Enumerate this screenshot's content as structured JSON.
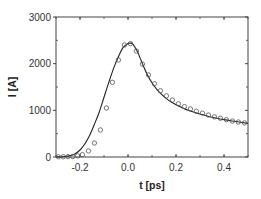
{
  "chart_data": {
    "type": "line",
    "title": "",
    "xlabel": "t [ps]",
    "ylabel": "I  [A]",
    "xlim": [
      -0.3,
      0.5
    ],
    "ylim": [
      0,
      3000
    ],
    "x_ticks": [
      -0.2,
      0.0,
      0.2,
      0.4
    ],
    "x_tick_labels": [
      "-0.2",
      "0.0",
      "0.2",
      "0.4"
    ],
    "y_ticks": [
      0,
      1000,
      2000,
      3000
    ],
    "y_tick_labels": [
      "0",
      "1000",
      "2000",
      "3000"
    ],
    "grid": false,
    "legend": null,
    "series": [
      {
        "name": "fit",
        "style": "solid-line",
        "x": [
          -0.3,
          -0.26,
          -0.24,
          -0.22,
          -0.2,
          -0.18,
          -0.16,
          -0.14,
          -0.12,
          -0.1,
          -0.08,
          -0.06,
          -0.04,
          -0.02,
          0.0,
          0.01,
          0.02,
          0.04,
          0.06,
          0.08,
          0.1,
          0.12,
          0.14,
          0.16,
          0.18,
          0.2,
          0.25,
          0.3,
          0.35,
          0.4,
          0.45,
          0.5
        ],
        "y": [
          0,
          10,
          30,
          70,
          150,
          280,
          460,
          700,
          960,
          1280,
          1600,
          1900,
          2150,
          2350,
          2430,
          2440,
          2420,
          2250,
          2000,
          1770,
          1590,
          1450,
          1340,
          1250,
          1180,
          1120,
          1000,
          920,
          850,
          800,
          760,
          720
        ]
      },
      {
        "name": "data",
        "style": "open-circles",
        "x": [
          -0.29,
          -0.27,
          -0.25,
          -0.23,
          -0.21,
          -0.19,
          -0.165,
          -0.14,
          -0.115,
          -0.09,
          -0.065,
          -0.04,
          -0.015,
          0.01,
          0.035,
          0.06,
          0.085,
          0.11,
          0.135,
          0.16,
          0.185,
          0.21,
          0.235,
          0.26,
          0.285,
          0.31,
          0.335,
          0.36,
          0.385,
          0.41,
          0.435,
          0.46,
          0.485
        ],
        "y": [
          5,
          5,
          8,
          10,
          25,
          50,
          130,
          300,
          580,
          1050,
          1600,
          2080,
          2400,
          2430,
          2270,
          1990,
          1760,
          1570,
          1420,
          1310,
          1220,
          1140,
          1080,
          1030,
          980,
          940,
          900,
          860,
          830,
          800,
          770,
          750,
          730
        ]
      }
    ]
  }
}
